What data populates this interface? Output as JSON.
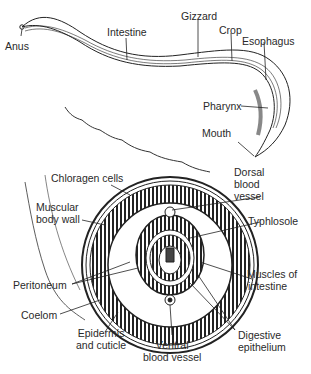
{
  "diagram": {
    "whole_worm_labels": [
      {
        "id": "anus",
        "text": "Anus"
      },
      {
        "id": "intestine",
        "text": "Intestine"
      },
      {
        "id": "gizzard",
        "text": "Gizzard"
      },
      {
        "id": "crop",
        "text": "Crop"
      },
      {
        "id": "esophagus",
        "text": "Esophagus"
      },
      {
        "id": "pharynx",
        "text": "Pharynx"
      },
      {
        "id": "mouth",
        "text": "Mouth"
      }
    ],
    "cross_section_labels": [
      {
        "id": "chloragen-cells",
        "text": "Chloragen cells"
      },
      {
        "id": "dorsal-blood-vessel",
        "lines": [
          "Dorsal",
          "blood",
          "vessel"
        ]
      },
      {
        "id": "muscular-body-wall",
        "lines": [
          "Muscular",
          "body wall"
        ]
      },
      {
        "id": "typhlosole",
        "text": "Typhlosole"
      },
      {
        "id": "peritoneum",
        "text": "Peritoneum"
      },
      {
        "id": "muscles-of-intestine",
        "lines": [
          "Muscles of",
          "intestine"
        ]
      },
      {
        "id": "coelom",
        "text": "Coelom"
      },
      {
        "id": "epidermis-and-cuticle",
        "lines": [
          "Epidermis",
          "and cuticle"
        ]
      },
      {
        "id": "ventral-blood-vessel",
        "lines": [
          "Ventral",
          "blood vessel"
        ]
      },
      {
        "id": "digestive-epithelium",
        "lines": [
          "Digestive",
          "epithelium"
        ]
      }
    ]
  }
}
